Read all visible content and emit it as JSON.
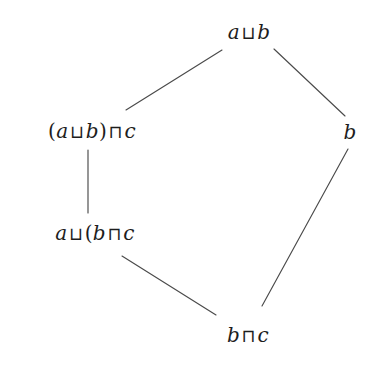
{
  "figure": {
    "kind": "hasse-diagram",
    "title": "",
    "background_color": "#ffffff",
    "line_color": "#4a4a4a",
    "text_color": "#1d1d1d",
    "width": 378,
    "height": 365
  },
  "nodes": [
    {
      "id": "join-ab",
      "label": "a ⊔ b",
      "parts": [
        {
          "text": "a",
          "kind": "var"
        },
        {
          "text": "⊔",
          "kind": "op"
        },
        {
          "text": "b",
          "kind": "var"
        }
      ],
      "x": 249,
      "y": 32
    },
    {
      "id": "meet-join-ab-c",
      "label": "(a ⊔ b) ⊓ c",
      "parts": [
        {
          "text": "(",
          "kind": "paren"
        },
        {
          "text": "a",
          "kind": "var"
        },
        {
          "text": "⊔",
          "kind": "op"
        },
        {
          "text": "b",
          "kind": "var"
        },
        {
          "text": ")",
          "kind": "paren"
        },
        {
          "text": "⊓",
          "kind": "op"
        },
        {
          "text": "c",
          "kind": "var"
        }
      ],
      "x": 92,
      "y": 131
    },
    {
      "id": "node-b",
      "label": "b",
      "parts": [
        {
          "text": "b",
          "kind": "var"
        }
      ],
      "x": 350,
      "y": 132
    },
    {
      "id": "join-a-meet-bc",
      "label": "a ⊔ (b ⊓ c",
      "parts": [
        {
          "text": "a",
          "kind": "var"
        },
        {
          "text": "⊔",
          "kind": "op"
        },
        {
          "text": "(",
          "kind": "paren"
        },
        {
          "text": "b",
          "kind": "var"
        },
        {
          "text": "⊓",
          "kind": "op"
        },
        {
          "text": "c",
          "kind": "var"
        }
      ],
      "x": 95,
      "y": 233
    },
    {
      "id": "meet-bc",
      "label": "b ⊓ c",
      "parts": [
        {
          "text": "b",
          "kind": "var"
        },
        {
          "text": "⊓",
          "kind": "op"
        },
        {
          "text": "c",
          "kind": "var"
        }
      ],
      "x": 248,
      "y": 335
    }
  ],
  "edges": [
    {
      "id": "edge-joinab-to-meetjoinabc",
      "from": "join-ab",
      "to": "meet-join-ab-c",
      "x1": 222,
      "y1": 50,
      "x2": 126,
      "y2": 110
    },
    {
      "id": "edge-joinab-to-b",
      "from": "join-ab",
      "to": "node-b",
      "x1": 274,
      "y1": 49,
      "x2": 345,
      "y2": 116
    },
    {
      "id": "edge-meetjoinabc-to-joinameetbc",
      "from": "meet-join-ab-c",
      "to": "join-a-meet-bc",
      "x1": 88,
      "y1": 150,
      "x2": 88,
      "y2": 213
    },
    {
      "id": "edge-joinameetbc-to-meetbc",
      "from": "join-a-meet-bc",
      "to": "meet-bc",
      "x1": 122,
      "y1": 256,
      "x2": 216,
      "y2": 315
    },
    {
      "id": "edge-b-to-meetbc",
      "from": "node-b",
      "to": "meet-bc",
      "x1": 348,
      "y1": 149,
      "x2": 262,
      "y2": 306
    }
  ]
}
